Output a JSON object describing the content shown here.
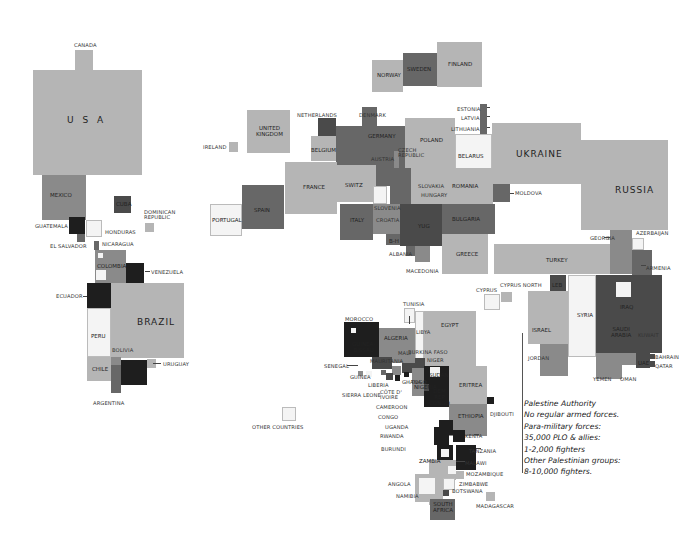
{
  "colors": {
    "light": "#b5b5b5",
    "mid": "#8a8a8a",
    "dark": "#676767",
    "darker": "#4a4a4a",
    "black": "#1e1e1e",
    "white": "#f4f4f4"
  },
  "regions": {
    "americas": [
      "CANADA",
      "USA",
      "MEXICO",
      "CUBA",
      "DOMINICAN REPUBLIC",
      "GUATEMALA",
      "EL SALVADOR",
      "HONDURAS",
      "NICARAGUA",
      "COLOMBIA",
      "VENEZUELA",
      "ECUADOR",
      "BRAZIL",
      "PERU",
      "BOLIVIA",
      "CHILE",
      "PARAGUAY",
      "URUGUAY",
      "ARGENTINA"
    ],
    "europe": [
      "NORWAY",
      "SWEDEN",
      "FINLAND",
      "IRELAND",
      "UNITED KINGDOM",
      "NETHERLANDS",
      "DENMARK",
      "GERMANY",
      "POLAND",
      "ESTONIA",
      "LATVIA",
      "LITHUANIA",
      "BELARUS",
      "UKRAINE",
      "BELGIUM",
      "CZECH REPUBLIC",
      "AUSTRIA",
      "FRANCE",
      "SWITZ",
      "SLOVAKIA",
      "HUNGARY",
      "ROMANIA",
      "MOLDOVA",
      "PORTUGAL",
      "SPAIN",
      "ITALY",
      "SLOVENIA",
      "CROATIA",
      "YUG",
      "B-H",
      "BULGARIA",
      "ALBANIA",
      "MACEDONIA",
      "GREECE",
      "RUSSIA"
    ],
    "middle_east": [
      "GEORGIA",
      "AZERBAIJAN",
      "ARMENIA",
      "TURKEY",
      "CYPRUS",
      "CYPRUS NORTH",
      "LEB",
      "ISRAEL",
      "SYRIA",
      "JORDAN",
      "IRAQ",
      "SAUDI ARABIA",
      "KUWAIT",
      "BAHRAIN",
      "QATAR",
      "UAE",
      "YEMEN",
      "OMAN"
    ],
    "africa": [
      "TUNISIA",
      "MOROCCO",
      "ALGERIA",
      "LIBYA",
      "EGYPT",
      "GUINEA-BISSAU",
      "MAURITANIA",
      "MALI",
      "BURKINA FASO",
      "NIGER",
      "SENEGAL",
      "GUINEA",
      "LIBERIA",
      "SIERRA LEONE",
      "COTE D'IVOIRE",
      "GHANA",
      "TOGO",
      "NIGERIA",
      "SUDAN",
      "ERITREA",
      "DEM REP CONGO",
      "CAMEROON",
      "CONGO",
      "ETHIOPIA",
      "DJIBOUTI",
      "UGANDA",
      "RWANDA",
      "KENYA",
      "BURUNDI",
      "TANZANIA",
      "ZAMBIA",
      "MALAWI",
      "MOZAMBIQUE",
      "ANGOLA",
      "ZIMBABWE",
      "BOTSWANA",
      "NAMIBIA",
      "SOUTH AFRICA",
      "MADAGASCAR"
    ]
  },
  "labels": {
    "canada": "CANADA",
    "usa": "U S A",
    "mexico": "MEXICO",
    "cuba": "CUBA",
    "dominican": "DOMINICAN\nREPUBLIC",
    "guatemala": "GUATEMALA",
    "el_salvador": "EL SALVADOR",
    "honduras": "HONDURAS",
    "nicaragua": "NICARAGUA",
    "colombia": "COLOMBIA",
    "venezuela": "VENEZUELA",
    "ecuador": "ECUADOR",
    "brazil": "BRAZIL",
    "peru": "PERU",
    "bolivia": "BOLIVIA",
    "chile": "CHILE",
    "paraguay": "PARAGUAY",
    "uruguay": "URUGUAY",
    "argentina": "ARGENTINA",
    "norway": "NORWAY",
    "sweden": "SWEDEN",
    "finland": "FINLAND",
    "ireland": "IRELAND",
    "uk": "UNITED\nKINGDOM",
    "netherlands": "NETHERLANDS",
    "denmark": "DENMARK",
    "germany": "GERMANY",
    "poland": "POLAND",
    "estonia": "ESTONIA",
    "latvia": "LATVIA",
    "lithuania": "LITHUANIA",
    "belarus": "BELARUS",
    "ukraine": "UKRAINE",
    "belgium": "BELGIUM",
    "czech": "CZECH\nREPUBLIC",
    "austria": "AUSTRIA",
    "france": "FRANCE",
    "switz": "SWITZ",
    "slovakia": "SLOVAKIA",
    "hungary": "HUNGARY",
    "romania": "ROMANIA",
    "moldova": "MOLDOVA",
    "portugal": "PORTUGAL",
    "spain": "SPAIN",
    "italy": "ITALY",
    "slovenia": "SLOVENIA",
    "croatia": "CROATIA",
    "yug": "YUG",
    "bh": "B-H",
    "bulgaria": "BULGARIA",
    "albania": "ALBANIA",
    "macedonia": "MACEDONIA",
    "greece": "GREECE",
    "russia": "RUSSIA",
    "georgia": "GEORGIA",
    "azerbaijan": "AZERBAIJAN",
    "armenia": "ARMENIA",
    "turkey": "TURKEY",
    "cyprus": "CYPRUS",
    "cyprus_north": "CYPRUS NORTH",
    "leb": "LEB",
    "israel": "ISRAEL",
    "syria": "SYRIA",
    "jordan": "JORDAN",
    "iraq": "IRAQ",
    "saudi": "SAUDI\nARABIA",
    "kuwait": "KUWAIT",
    "bahrain": "BAHRAIN",
    "qatar": "QATAR",
    "uae": "UAE",
    "yemen": "YEMEN",
    "oman": "OMAN",
    "tunisia": "TUNISIA",
    "morocco": "MOROCCO",
    "algeria": "ALGERIA",
    "libya": "LIBYA",
    "egypt": "EGYPT",
    "guinea_bissau": "GUINEA-\nBISSAU",
    "mauritania": "MAURITANIA",
    "mali": "MALI",
    "burkina": "BURKINA FASO",
    "niger": "NIGER",
    "senegal": "SENEGAL",
    "guinea": "GUINEA",
    "liberia": "LIBERIA",
    "sierra_leone": "SIERRA LEONE",
    "cote": "CÔTE d'\nIVOIRE",
    "ghana": "GHANA",
    "togo": "TOGO",
    "nigeria": "NIGERIA",
    "sudan": "SUDAN",
    "eritrea": "ERITREA",
    "drc": "DEM\nREP\nCONGO",
    "cameroon": "CAMEROON",
    "congo": "CONGO",
    "ethiopia": "ETHIOPIA",
    "djibouti": "DJIBOUTI",
    "uganda": "UGANDA",
    "rwanda": "RWANDA",
    "kenya": "KENYA",
    "burundi": "BURUNDI",
    "tanzania": "TANZANIA",
    "zambia": "ZAMBIA",
    "malawi": "MALAWI",
    "mozambique": "MOZAMBIQUE",
    "angola": "ANGOLA",
    "zimbabwe": "ZIMBABWE",
    "botswana": "BOTSWANA",
    "namibia": "NAMIBIA",
    "south_africa": "SOUTH\nAFRICA",
    "madagascar": "MADAGASCAR",
    "other": "OTHER COUNTRIES"
  },
  "note": {
    "lines": [
      "Palestine Authority",
      "No regular armed forces.",
      "Para-military forces:",
      "35,000 PLO & allies:",
      "1-2,000 fighters",
      "Other Palestinian groups:",
      "8-10,000 fighters."
    ]
  }
}
